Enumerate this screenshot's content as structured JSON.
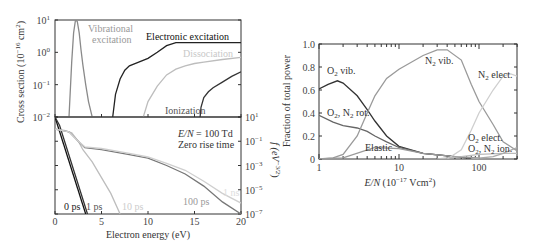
{
  "chart_data": [
    {
      "id": "cross_sections",
      "type": "line",
      "title": "",
      "xlabel": "Electron energy (eV)",
      "ylabel": "Cross section (10^-16 cm^2)",
      "yscale": "log",
      "xlim": [
        0,
        20
      ],
      "ylim": [
        0.01,
        10
      ],
      "yticks": [
        "10^1",
        "10^0",
        "10^-1",
        "10^-2"
      ],
      "series": [
        {
          "name": "Vibrational excitation",
          "color": "#8a8a8a",
          "x": [
            1.5,
            1.8,
            2.0,
            2.2,
            2.4,
            2.6,
            2.8,
            3.0,
            3.3,
            3.6,
            4.0
          ],
          "y": [
            0.01,
            0.5,
            4,
            10,
            9,
            4,
            1.2,
            0.4,
            0.1,
            0.03,
            0.01
          ]
        },
        {
          "name": "Electronic excitation",
          "color": "#222222",
          "x": [
            6.2,
            6.5,
            7.0,
            7.5,
            8.0,
            9.0,
            10.0,
            11.0,
            12.0,
            13.0,
            14.0,
            20.0
          ],
          "y": [
            0.01,
            0.05,
            0.15,
            0.28,
            0.38,
            0.5,
            0.65,
            1.0,
            1.6,
            2.0,
            2.0,
            2.0
          ]
        },
        {
          "name": "Dissociation",
          "color": "#bdbdbd",
          "x": [
            9.5,
            10.0,
            11.0,
            12.0,
            13.0,
            14.0,
            15.0,
            16.0,
            18.0,
            20.0
          ],
          "y": [
            0.01,
            0.03,
            0.09,
            0.2,
            0.3,
            0.38,
            0.45,
            0.5,
            0.6,
            0.7
          ]
        },
        {
          "name": "Ionization",
          "color": "#333333",
          "x": [
            15.6,
            15.7,
            16.0,
            16.5,
            17.0,
            18.0,
            19.0,
            20.0
          ],
          "y": [
            0.01,
            0.02,
            0.04,
            0.06,
            0.08,
            0.12,
            0.18,
            0.25
          ]
        }
      ],
      "annotations": [
        "Vibrational excitation",
        "Electronic excitation",
        "Dissociation",
        "Ionization"
      ]
    },
    {
      "id": "eedf",
      "type": "line",
      "xlabel": "Electron energy (eV)",
      "ylabel": "f(eV^-3/2)",
      "yscale": "log",
      "xlim": [
        0,
        20
      ],
      "ylim": [
        1e-07,
        10
      ],
      "xticks": [
        0,
        5,
        10,
        15,
        20
      ],
      "yticks": [
        "10^1",
        "10^-1",
        "10^-3",
        "10^-5",
        "10^-7"
      ],
      "annotations": [
        "E/N = 100 Td",
        "Zero rise time"
      ],
      "series": [
        {
          "name": "0 ps",
          "color": "#111111",
          "x": [
            0,
            3.3
          ],
          "y": [
            10,
            1e-07
          ]
        },
        {
          "name": "1 ps",
          "color": "#333333",
          "x": [
            0,
            0.5,
            3.5
          ],
          "y": [
            10,
            2,
            1e-07
          ]
        },
        {
          "name": "10 ps",
          "color": "#bdbdbd",
          "x": [
            0,
            1.0,
            1.8,
            2.5,
            3.0,
            4.0,
            5.0,
            6.0,
            7.0
          ],
          "y": [
            1,
            0.8,
            0.5,
            0.1,
            0.02,
            0.002,
            0.0001,
            5e-06,
            1e-07
          ]
        },
        {
          "name": "100 ps",
          "color": "#777777",
          "x": [
            0,
            1.5,
            2.5,
            3.2,
            5,
            8,
            10,
            12,
            14,
            16,
            18,
            20
          ],
          "y": [
            1,
            0.6,
            0.1,
            0.03,
            0.02,
            0.008,
            0.004,
            0.001,
            0.0002,
            2e-05,
            1e-06,
            1e-07
          ]
        },
        {
          "name": "1 ns",
          "color": "#cfcfcf",
          "x": [
            0,
            1.5,
            2.5,
            3.2,
            5,
            8,
            10,
            12,
            14,
            16,
            18,
            20
          ],
          "y": [
            1,
            0.6,
            0.1,
            0.035,
            0.025,
            0.01,
            0.005,
            0.0015,
            0.0004,
            5e-05,
            5e-06,
            8e-07
          ]
        }
      ]
    },
    {
      "id": "power_fraction",
      "type": "line",
      "xlabel": "E/N (10^-17 Vcm^2)",
      "ylabel": "Fraction of total power",
      "xscale": "log",
      "xlim": [
        1,
        300
      ],
      "ylim": [
        0,
        1.0
      ],
      "xticks": [
        1,
        10,
        100
      ],
      "yticks": [
        0,
        0.2,
        0.4,
        0.6,
        0.8,
        1.0
      ],
      "series": [
        {
          "name": "O2 vib.",
          "color": "#333333",
          "x": [
            1,
            1.3,
            1.7,
            2,
            3,
            4,
            5,
            7,
            10,
            20,
            50,
            100
          ],
          "y": [
            0.61,
            0.65,
            0.68,
            0.66,
            0.55,
            0.43,
            0.33,
            0.2,
            0.11,
            0.05,
            0.02,
            0.0
          ]
        },
        {
          "name": "O2, N2 rot.",
          "color": "#666666",
          "x": [
            1,
            1.5,
            2,
            3,
            4,
            5,
            7,
            10,
            20,
            50,
            100
          ],
          "y": [
            0.38,
            0.32,
            0.29,
            0.27,
            0.24,
            0.2,
            0.15,
            0.1,
            0.05,
            0.02,
            0.0
          ]
        },
        {
          "name": "Elastic",
          "color": "#999999",
          "x": [
            1,
            2,
            5,
            10,
            20,
            50,
            100
          ],
          "y": [
            0.0,
            0.01,
            0.1,
            0.09,
            0.05,
            0.02,
            0.01
          ]
        },
        {
          "name": "N2 vib.",
          "color": "#9a9a9a",
          "x": [
            1,
            1.5,
            2,
            3,
            4,
            5,
            7,
            10,
            20,
            30,
            40,
            60,
            80,
            100,
            150,
            200,
            300
          ],
          "y": [
            0.0,
            0.01,
            0.04,
            0.2,
            0.4,
            0.55,
            0.7,
            0.78,
            0.9,
            0.95,
            0.95,
            0.86,
            0.65,
            0.5,
            0.3,
            0.15,
            0.07
          ]
        },
        {
          "name": "N2 elect.",
          "color": "#cfcfcf",
          "x": [
            40,
            60,
            80,
            100,
            150,
            200,
            250,
            300
          ],
          "y": [
            0.0,
            0.08,
            0.25,
            0.4,
            0.6,
            0.72,
            0.74,
            0.72
          ]
        },
        {
          "name": "O2 elect.",
          "color": "#bbbbbb",
          "x": [
            30,
            60,
            100,
            200,
            300
          ],
          "y": [
            0.0,
            0.02,
            0.04,
            0.05,
            0.05
          ]
        },
        {
          "name": "O2, N2 ion.",
          "color": "#aaaaaa",
          "x": [
            80,
            150,
            200,
            300
          ],
          "y": [
            0.0,
            0.02,
            0.05,
            0.1
          ]
        }
      ],
      "annotations": [
        "O2 vib.",
        "O2, N2 rot.",
        "Elastic",
        "N2 vib.",
        "N2 elect.",
        "O2 elect.",
        "O2, N2 ion."
      ]
    }
  ],
  "labels": {
    "left_ylabel_top": "Cross section (10",
    "left_ylabel_top_exp": "−16",
    "left_ylabel_top_unit": " cm",
    "left_ylabel_top_exp2": "2",
    "left_ylabel_top_close": ")",
    "left_ylabel_bottom": "f (eV",
    "left_ylabel_bottom_exp": "−3/2",
    "left_ylabel_bottom_close": ")",
    "left_xlabel": "Electron energy (eV)",
    "vib_line1": "Vibrational",
    "vib_line2": "excitation",
    "electronic": "Electronic excitation",
    "dissociation": "Dissociation",
    "ionization": "Ionization",
    "en_label": "E/N",
    "en_value": " = 100 Td",
    "zero_rise": "Zero rise time",
    "ps0": "0 ps",
    "ps1": "1 ps",
    "ps10": "10 ps",
    "ps100": "100 ps",
    "ns1": "1 ns",
    "right_ylabel": "Fraction of total power",
    "right_xlabel_en": "E/N",
    "right_xlabel_unit": " (10",
    "right_xlabel_exp": "−17",
    "right_xlabel_unit2": " Vcm",
    "right_xlabel_exp2": "2",
    "right_xlabel_close": ")",
    "o2vib": "O",
    "o2vib_sub": "2",
    "o2vib_rest": " vib.",
    "rot_a": "O",
    "rot_a_sub": "2",
    "rot_b": ", N",
    "rot_b_sub": "2",
    "rot_rest": " rot.",
    "elastic": "Elastic",
    "n2vib": "N",
    "n2vib_sub": "2",
    "n2vib_rest": " vib.",
    "n2elect": "N",
    "n2elect_sub": "2",
    "n2elect_rest": " elect.",
    "o2elect": "O",
    "o2elect_sub": "2",
    "o2elect_rest": " elect.",
    "ion_a": "O",
    "ion_a_sub": "2",
    "ion_b": ", N",
    "ion_b_sub": "2",
    "ion_rest": " ion."
  },
  "ticks": {
    "left_x": [
      "0",
      "5",
      "10",
      "15",
      "20"
    ],
    "left_top_y": [
      {
        "b": "10",
        "e": "1"
      },
      {
        "b": "10",
        "e": "0"
      },
      {
        "b": "10",
        "e": "−1"
      },
      {
        "b": "10",
        "e": "−2"
      }
    ],
    "left_bot_y": [
      {
        "b": "10",
        "e": "1"
      },
      {
        "b": "10",
        "e": "−1"
      },
      {
        "b": "10",
        "e": "−3"
      },
      {
        "b": "10",
        "e": "−5"
      },
      {
        "b": "10",
        "e": "−7"
      }
    ],
    "right_x": [
      "1",
      "10",
      "100"
    ],
    "right_y": [
      "1.0",
      "0.8",
      "0.6",
      "0.4",
      "0.2",
      "0"
    ]
  }
}
